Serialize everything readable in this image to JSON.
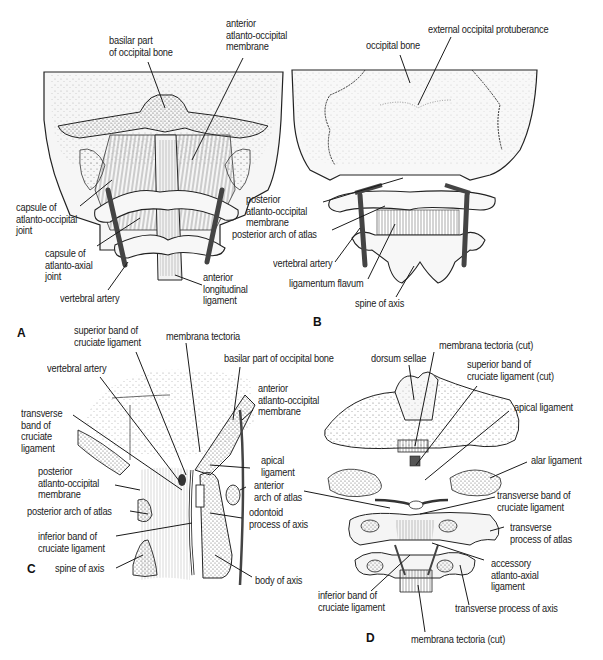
{
  "figure": {
    "panels": [
      {
        "id": "A",
        "letter": "A",
        "labels": {
          "basilar_part": "basilar part\nof occipital bone",
          "anterior_ao_membrane": "anterior\natlanto-occipital\nmembrane",
          "capsule_ao_joint": "capsule of\natlanto-occipital\njoint",
          "capsule_aa_joint": "capsule of\natlanto-axial\njoint",
          "vertebral_artery": "vertebral artery",
          "anterior_longitudinal_ligament": "anterior\nlongitudinal\nligament"
        }
      },
      {
        "id": "B",
        "letter": "B",
        "labels": {
          "occipital_bone": "occipital bone",
          "external_occipital_protuberance": "external occipital protuberance",
          "posterior_ao_membrane": "posterior\natlanto-occipital\nmembrane",
          "posterior_arch_atlas": "posterior arch of atlas",
          "vertebral_artery": "vertebral artery",
          "ligamentum_flavum": "ligamentum flavum",
          "spine_of_axis": "spine of axis"
        }
      },
      {
        "id": "C",
        "letter": "C",
        "labels": {
          "superior_band": "superior band of\ncruciate ligament",
          "membrana_tectoria": "membrana tectoria",
          "basilar_part": "basilar part of occipital bone",
          "vertebral_artery": "vertebral artery",
          "anterior_ao_membrane": "anterior\natlanto-occipital\nmembrane",
          "transverse_band": "transverse\nband of\ncruciate\nligament",
          "apical_ligament": "apical\nligament",
          "posterior_ao_membrane": "posterior\natlanto-occipital\nmembrane",
          "anterior_arch_atlas": "anterior\narch of atlas",
          "posterior_arch_atlas": "posterior arch of atlas",
          "odontoid_process": "odontoid\nprocess of axis",
          "inferior_band": "inferior band of\ncruciate ligament",
          "spine_of_axis": "spine of axis",
          "body_of_axis": "body of axis"
        }
      },
      {
        "id": "D",
        "letter": "D",
        "labels": {
          "membrana_tectoria_cut_top": "membrana tectoria (cut)",
          "dorsum_sellae": "dorsum sellae",
          "superior_band_cut": "superior band of\ncruciate ligament (cut)",
          "apical_ligament": "apical ligament",
          "alar_ligament": "alar ligament",
          "transverse_band": "transverse band of\ncruciate ligament",
          "transverse_process_atlas": "transverse\nprocess of atlas",
          "accessory_aa_ligament": "accessory\natlanto-axial\nligament",
          "inferior_band": "inferior band of\ncruciate ligament",
          "transverse_process_axis": "transverse process of axis",
          "membrana_tectoria_cut_bottom": "membrana tectoria (cut)"
        }
      }
    ]
  },
  "colors": {
    "ink": "#1a1a1a",
    "bone_fill": "#f4f4f4",
    "stipple": "#8a8a8a",
    "artery": "#4a4a4a",
    "background": "#ffffff"
  }
}
